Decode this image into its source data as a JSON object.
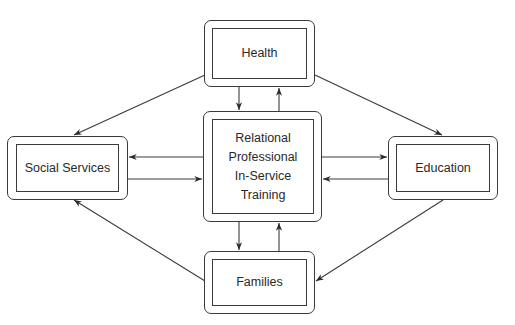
{
  "diagram": {
    "type": "hub-and-spoke flow diagram",
    "nodes": {
      "health": {
        "label": "Health"
      },
      "center": {
        "label_lines": [
          "Relational",
          "Professional",
          "In-Service",
          "Training"
        ]
      },
      "social": {
        "label": "Social Services"
      },
      "education": {
        "label": "Education"
      },
      "families": {
        "label": "Families"
      }
    },
    "edges": [
      {
        "from": "Health",
        "to": "Relational Professional In-Service Training"
      },
      {
        "from": "Relational Professional In-Service Training",
        "to": "Health"
      },
      {
        "from": "Social Services",
        "to": "Relational Professional In-Service Training"
      },
      {
        "from": "Relational Professional In-Service Training",
        "to": "Social Services"
      },
      {
        "from": "Education",
        "to": "Relational Professional In-Service Training"
      },
      {
        "from": "Relational Professional In-Service Training",
        "to": "Education"
      },
      {
        "from": "Families",
        "to": "Relational Professional In-Service Training"
      },
      {
        "from": "Relational Professional In-Service Training",
        "to": "Families"
      },
      {
        "from": "Health",
        "to": "Social Services"
      },
      {
        "from": "Health",
        "to": "Education"
      },
      {
        "from": "Families",
        "to": "Social Services"
      },
      {
        "from": "Education",
        "to": "Families"
      }
    ],
    "colors": {
      "stroke": "#3a3a3a",
      "text": "#2a2a2a",
      "background": "#ffffff"
    }
  }
}
